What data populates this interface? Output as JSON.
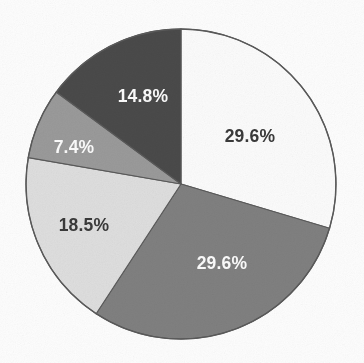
{
  "figure": {
    "background_color": "#fdfdfd",
    "outline_color": "#5a5a5a"
  },
  "chart_data": {
    "type": "pie",
    "title": "",
    "subtitle": "",
    "xlabel": "",
    "ylabel": "",
    "grid": false,
    "legend": "none",
    "start_angle_deg": 0,
    "direction": "clockwise",
    "center": {
      "x": 181,
      "y": 184
    },
    "radius": 155,
    "units": "percent",
    "total": 100.0,
    "categories": [
      "Slice 1",
      "Slice 2",
      "Slice 3",
      "Slice 4",
      "Slice 5"
    ],
    "values": [
      29.6,
      29.6,
      18.5,
      7.4,
      14.8
    ],
    "labels": [
      "29.6%",
      "29.6%",
      "18.5%",
      "7.4%",
      "14.8%"
    ],
    "colors": [
      "#fbfbfb",
      "#808080",
      "#dedede",
      "#9a9a9a",
      "#4a4a4a"
    ],
    "label_colors": [
      "#3a3a3a",
      "#fbfbfb",
      "#3a3a3a",
      "#fbfbfb",
      "#fbfbfb"
    ],
    "slices": [
      {
        "label": "29.6%",
        "value": 29.6,
        "color": "#fbfbfb",
        "label_color": "#3a3a3a",
        "start_deg": 0.0,
        "end_deg": 106.6,
        "label_x": 250,
        "label_y": 137
      },
      {
        "label": "29.6%",
        "value": 29.6,
        "color": "#808080",
        "label_color": "#fbfbfb",
        "start_deg": 106.6,
        "end_deg": 213.2,
        "label_x": 222,
        "label_y": 264
      },
      {
        "label": "18.5%",
        "value": 18.5,
        "color": "#dedede",
        "label_color": "#3a3a3a",
        "start_deg": 213.2,
        "end_deg": 279.8,
        "label_x": 84,
        "label_y": 226
      },
      {
        "label": "7.4%",
        "value": 7.4,
        "color": "#9a9a9a",
        "label_color": "#fbfbfb",
        "start_deg": 279.8,
        "end_deg": 306.4,
        "label_x": 74,
        "label_y": 148
      },
      {
        "label": "14.8%",
        "value": 14.8,
        "color": "#4a4a4a",
        "label_color": "#fbfbfb",
        "start_deg": 306.4,
        "end_deg": 360.0,
        "label_x": 143,
        "label_y": 97
      }
    ]
  }
}
